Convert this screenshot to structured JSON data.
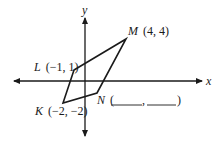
{
  "figure": {
    "type": "coordinate-plane-parallelogram",
    "axes": {
      "x_label": "x",
      "y_label": "y"
    },
    "vertices": [
      {
        "name": "M",
        "x": 4,
        "y": 4,
        "label": "M (4, 4)",
        "letter": "M",
        "coords": "(4, 4)"
      },
      {
        "name": "L",
        "x": -1,
        "y": 1,
        "label": "L (−1, 1)",
        "letter": "L",
        "coords": "(−1, 1)"
      },
      {
        "name": "K",
        "x": -2,
        "y": -2,
        "label": "K (−2, −2)",
        "letter": "K",
        "coords": "(−2, −2)"
      },
      {
        "name": "N",
        "x": null,
        "y": null,
        "label": "N (____, ____)",
        "letter": "N",
        "open_paren": "(",
        "comma": ",",
        "close_paren": ")"
      }
    ],
    "order": [
      "L",
      "M",
      "N",
      "K"
    ]
  }
}
